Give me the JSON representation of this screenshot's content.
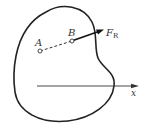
{
  "diagram": {
    "labels": {
      "point_a": "A",
      "point_b": "B",
      "force": "F",
      "force_subscript": "R",
      "axis": "x"
    },
    "colors": {
      "stroke": "#222222",
      "text": "#333333",
      "background": "#ffffff"
    }
  }
}
